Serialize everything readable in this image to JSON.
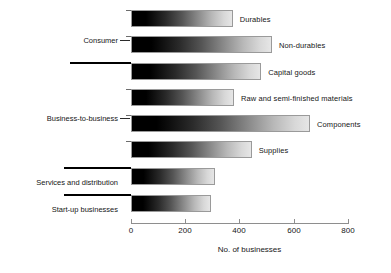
{
  "chart_data": {
    "type": "bar",
    "orientation": "horizontal",
    "title": "",
    "xlabel": "No. of businesses",
    "ylabel": "",
    "xlim": [
      0,
      800
    ],
    "xticks": [
      0,
      200,
      400,
      600,
      800
    ],
    "xtick_labels": [
      "0",
      "200",
      "400",
      "600",
      "800"
    ],
    "grid": false,
    "legend": null,
    "categories": [
      "Durables",
      "Non-durables",
      "Capital goods",
      "Raw and semi-finished materials",
      "Components",
      "Supplies",
      "Services and distribution",
      "Start-up businesses"
    ],
    "values": [
      375,
      520,
      480,
      380,
      660,
      445,
      310,
      295
    ],
    "groups": [
      {
        "label": "Consumer",
        "members": [
          "Durables",
          "Non-durables"
        ]
      },
      {
        "label": "Business-to-business",
        "members": [
          "Capital goods",
          "Raw and semi-finished materials",
          "Components",
          "Supplies"
        ]
      },
      {
        "label": "Services and distribution",
        "members": [
          "Services and distribution"
        ]
      },
      {
        "label": "Start-up businesses",
        "members": [
          "Start-up businesses"
        ]
      }
    ],
    "bar_style": {
      "fill": "horizontal-gradient-black-to-light-gray",
      "gradient_start": "#000000",
      "gradient_end": "#e6e6e6",
      "border": "#9a9a9a"
    },
    "axis_color": "#8e8e8e",
    "text_color": "#161616"
  }
}
